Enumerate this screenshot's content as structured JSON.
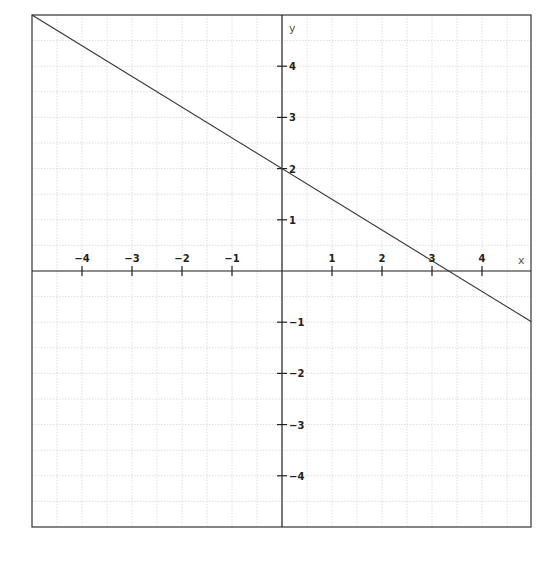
{
  "chart_data": {
    "type": "line",
    "title": "",
    "xlabel": "x",
    "ylabel": "y",
    "xlim": [
      -5,
      5
    ],
    "ylim": [
      -5,
      5
    ],
    "grid": true,
    "grid_step": 0.5,
    "x_ticks": [
      -4,
      -3,
      -2,
      -1,
      1,
      2,
      3,
      4
    ],
    "y_ticks": [
      -4,
      -3,
      -2,
      -1,
      1,
      2,
      3,
      4
    ],
    "x_tick_labels": [
      "−4",
      "−3",
      "−2",
      "−1",
      "1",
      "2",
      "3",
      "4"
    ],
    "y_tick_labels": [
      "−4",
      "−3",
      "−2",
      "−1",
      "1",
      "2",
      "3",
      "4"
    ],
    "series": [
      {
        "name": "y = -0.6x + 2",
        "slope": -0.6,
        "intercept": 2,
        "x": [
          -5,
          0,
          3.333,
          5
        ],
        "y": [
          5,
          2,
          0,
          -1
        ]
      }
    ],
    "legend": null
  },
  "colors": {
    "background": "#ffffff",
    "border": "#333333",
    "axis": "#222222",
    "grid": "#cfcfcf",
    "line": "#333333"
  },
  "labels": {
    "x_axis": "x",
    "y_axis": "y"
  }
}
